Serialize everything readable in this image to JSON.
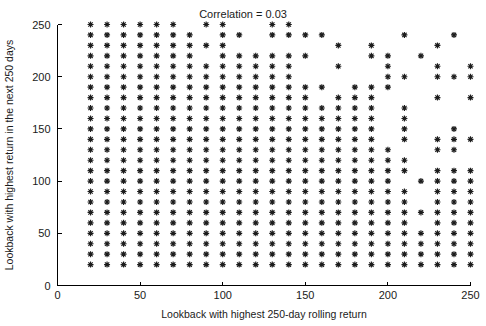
{
  "chart_data": {
    "type": "scatter",
    "title": "Correlation = 0.03",
    "xlabel": "Lookback with highest 250-day rolling return",
    "ylabel": "Lookback with highest return in the next 250 days",
    "xlim": [
      0,
      250
    ],
    "ylim": [
      0,
      250
    ],
    "xticks": [
      0,
      50,
      100,
      150,
      200,
      250
    ],
    "yticks": [
      0,
      50,
      100,
      150,
      200,
      250
    ],
    "xticklabels": [
      "0",
      "50",
      "100",
      "150",
      "200",
      "250"
    ],
    "yticklabels": [
      "0",
      "50",
      "100",
      "150",
      "200",
      "250"
    ],
    "grid": false,
    "legend": false,
    "marker": "star-plus-cross",
    "marker_color": "#1c1c1c",
    "marker_size": 6,
    "correlation": 0.03,
    "grid_step": 10,
    "series": [
      {
        "name": "lookback pairs",
        "points_by_y": {
          "250": [
            20,
            30,
            40,
            50,
            60,
            70,
            90,
            100,
            130,
            140
          ],
          "240": [
            20,
            30,
            40,
            50,
            60,
            70,
            80,
            100,
            110,
            130,
            140,
            150,
            160,
            210,
            240
          ],
          "230": [
            20,
            30,
            40,
            50,
            60,
            70,
            80,
            90,
            100,
            170,
            190,
            230
          ],
          "220": [
            20,
            30,
            40,
            50,
            60,
            70,
            80,
            100,
            110,
            120,
            130,
            140,
            150,
            190,
            200,
            220
          ],
          "210": [
            20,
            30,
            40,
            50,
            60,
            70,
            80,
            90,
            100,
            110,
            120,
            130,
            140,
            170,
            200,
            230,
            250
          ],
          "200": [
            20,
            30,
            40,
            50,
            60,
            70,
            80,
            90,
            100,
            110,
            120,
            130,
            140,
            200,
            210,
            230,
            240,
            250
          ],
          "190": [
            20,
            30,
            40,
            50,
            60,
            70,
            80,
            90,
            100,
            110,
            120,
            130,
            140,
            150,
            160,
            180,
            190,
            200
          ],
          "180": [
            20,
            30,
            40,
            50,
            60,
            70,
            80,
            90,
            100,
            110,
            120,
            130,
            140,
            150,
            170,
            180,
            190,
            230,
            250
          ],
          "170": [
            20,
            30,
            40,
            50,
            60,
            70,
            80,
            90,
            100,
            110,
            120,
            130,
            140,
            150,
            160,
            170,
            180,
            190,
            210
          ],
          "160": [
            20,
            30,
            40,
            50,
            60,
            70,
            80,
            90,
            100,
            110,
            120,
            130,
            140,
            150,
            160,
            170,
            180,
            190,
            210
          ],
          "150": [
            20,
            30,
            40,
            50,
            60,
            70,
            80,
            90,
            100,
            110,
            120,
            130,
            140,
            150,
            160,
            170,
            180,
            190,
            210,
            240
          ],
          "140": [
            20,
            30,
            40,
            50,
            60,
            70,
            80,
            90,
            100,
            110,
            120,
            130,
            140,
            150,
            160,
            170,
            180,
            190,
            210,
            230,
            240,
            250
          ],
          "130": [
            20,
            30,
            40,
            50,
            60,
            70,
            80,
            90,
            100,
            110,
            120,
            130,
            140,
            150,
            160,
            170,
            180,
            190,
            200,
            230,
            240
          ],
          "120": [
            20,
            30,
            40,
            50,
            60,
            70,
            80,
            90,
            100,
            110,
            120,
            130,
            140,
            150,
            160,
            170,
            180,
            190,
            200,
            210
          ],
          "110": [
            20,
            30,
            40,
            50,
            60,
            70,
            80,
            90,
            100,
            110,
            120,
            130,
            140,
            150,
            160,
            170,
            180,
            190,
            200,
            210,
            230,
            240,
            250
          ],
          "100": [
            20,
            30,
            40,
            50,
            60,
            70,
            80,
            90,
            100,
            110,
            120,
            130,
            140,
            150,
            160,
            170,
            180,
            190,
            200,
            220,
            230,
            240,
            250
          ],
          "90": [
            20,
            30,
            40,
            50,
            60,
            70,
            80,
            90,
            100,
            110,
            120,
            130,
            140,
            150,
            160,
            170,
            180,
            190,
            200,
            210,
            230,
            240,
            250
          ],
          "80": [
            20,
            30,
            40,
            50,
            60,
            70,
            80,
            90,
            100,
            110,
            120,
            130,
            140,
            150,
            160,
            170,
            180,
            190,
            200,
            210,
            230,
            240,
            250
          ],
          "70": [
            20,
            30,
            40,
            50,
            60,
            70,
            80,
            90,
            100,
            110,
            120,
            130,
            140,
            150,
            160,
            170,
            180,
            190,
            200,
            210,
            220,
            230,
            240,
            250
          ],
          "60": [
            20,
            30,
            40,
            50,
            60,
            70,
            80,
            90,
            100,
            110,
            120,
            130,
            140,
            150,
            160,
            170,
            180,
            190,
            200,
            210,
            230,
            240,
            250
          ],
          "50": [
            20,
            30,
            40,
            50,
            60,
            70,
            80,
            90,
            100,
            110,
            120,
            130,
            140,
            150,
            160,
            170,
            180,
            190,
            200,
            210,
            220,
            230,
            240,
            250
          ],
          "40": [
            20,
            30,
            40,
            50,
            60,
            70,
            80,
            90,
            100,
            110,
            120,
            130,
            140,
            150,
            160,
            170,
            180,
            190,
            200,
            210,
            220,
            230,
            240,
            250
          ],
          "30": [
            20,
            30,
            40,
            50,
            60,
            70,
            80,
            90,
            100,
            110,
            120,
            130,
            140,
            150,
            160,
            170,
            180,
            190,
            200,
            210,
            220,
            230,
            240,
            250
          ],
          "20": [
            20,
            30,
            40,
            50,
            60,
            70,
            80,
            90,
            100,
            110,
            120,
            130,
            140,
            150,
            160,
            170,
            180,
            190,
            200,
            210,
            220,
            230,
            240,
            250
          ]
        }
      }
    ]
  },
  "axes": {
    "title": "Correlation = 0.03",
    "xlabel": "Lookback with highest 250-day rolling return",
    "ylabel": "Lookback with highest return in the next 250 days"
  }
}
